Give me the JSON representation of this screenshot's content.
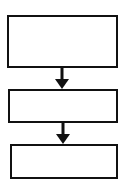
{
  "diagram": {
    "type": "flowchart",
    "direction": "top-to-bottom",
    "nodes": [
      {
        "id": "box-1",
        "label": ""
      },
      {
        "id": "box-2",
        "label": ""
      },
      {
        "id": "box-3",
        "label": ""
      }
    ],
    "edges": [
      {
        "from": "box-1",
        "to": "box-2"
      },
      {
        "from": "box-2",
        "to": "box-3"
      }
    ],
    "colors": {
      "stroke": "#111111",
      "fill": "#ffffff"
    }
  }
}
